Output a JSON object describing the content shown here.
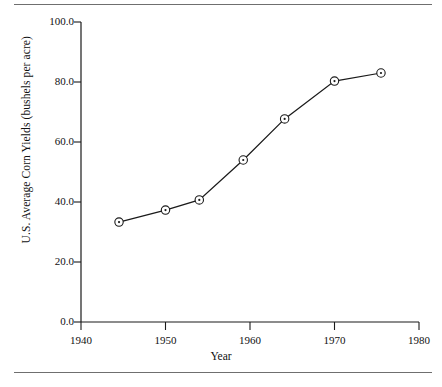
{
  "figure": {
    "top_rule": "horizontal-rule",
    "bottom_rule": "horizontal-rule"
  },
  "chart_data": {
    "type": "line",
    "title": "",
    "subtitle": "",
    "xlabel": "Year",
    "ylabel": "U.S. Average Corn Yields (bushels per acre)",
    "xlim": [
      1940,
      1980
    ],
    "ylim": [
      0.0,
      100.0
    ],
    "xticks": [
      1940,
      1950,
      1960,
      1970,
      1980
    ],
    "xticklabels": [
      "1940",
      "1950",
      "1960",
      "1970",
      "1980"
    ],
    "yticks": [
      0.0,
      20.0,
      40.0,
      60.0,
      80.0,
      100.0
    ],
    "yticklabels": [
      "0.0",
      "20.0",
      "40.0",
      "60.0",
      "80.0",
      "100.0"
    ],
    "grid": false,
    "legend": null,
    "marker": "circle-with-center-dot",
    "line_color": "#1a1a1a",
    "marker_face_color": "#ffffff",
    "marker_edge_color": "#1a1a1a",
    "x": [
      1944.5,
      1950.0,
      1954.0,
      1959.2,
      1964.1,
      1970.0,
      1975.5
    ],
    "values": [
      33.3,
      37.3,
      40.7,
      54.0,
      67.7,
      80.3,
      83.0
    ],
    "series": [
      {
        "name": "U.S. Average Corn Yields",
        "points": [
          {
            "x": 1944.5,
            "y": 33.3
          },
          {
            "x": 1950.0,
            "y": 37.3
          },
          {
            "x": 1954.0,
            "y": 40.7
          },
          {
            "x": 1959.2,
            "y": 54.0
          },
          {
            "x": 1964.1,
            "y": 67.7
          },
          {
            "x": 1970.0,
            "y": 80.3
          },
          {
            "x": 1975.5,
            "y": 83.0
          }
        ]
      }
    ]
  }
}
